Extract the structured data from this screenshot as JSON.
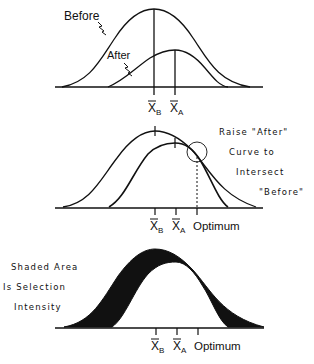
{
  "figure": {
    "panel1": {
      "curve_labels": {
        "before": "Before",
        "after": "After"
      },
      "ticks": {
        "mean_before": "X",
        "mean_before_sub": "B",
        "mean_after": "X",
        "mean_after_sub": "A"
      }
    },
    "panel2": {
      "annotation_lines": [
        "Raise \"After\"",
        "Curve to",
        "Intersect",
        "\"Before\""
      ],
      "ticks": {
        "mean_before": "X",
        "mean_before_sub": "B",
        "mean_after": "X",
        "mean_after_sub": "A",
        "optimum": "Optimum"
      }
    },
    "panel3": {
      "annotation_lines": [
        "Shaded Area",
        "Is Selection",
        "Intensity"
      ],
      "ticks": {
        "mean_before": "X",
        "mean_before_sub": "B",
        "mean_after": "X",
        "mean_after_sub": "A",
        "optimum": "Optimum"
      }
    },
    "colors": {
      "ink": "#111111",
      "background": "#ffffff"
    }
  }
}
